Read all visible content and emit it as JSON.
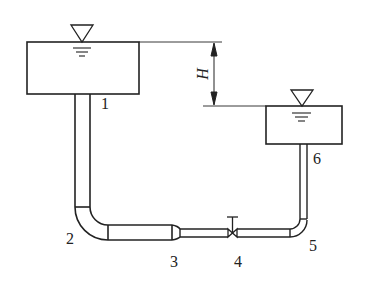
{
  "diagram": {
    "dimension": {
      "symbol": "H",
      "meaning": "head difference between free surfaces"
    },
    "labels": [
      {
        "id": "1",
        "text": "1",
        "x": 101,
        "y": 100
      },
      {
        "id": "2",
        "text": "2",
        "x": 66,
        "y": 234
      },
      {
        "id": "3",
        "text": "3",
        "x": 170,
        "y": 256
      },
      {
        "id": "4",
        "text": "4",
        "x": 234,
        "y": 256
      },
      {
        "id": "5",
        "text": "5",
        "x": 309,
        "y": 240
      },
      {
        "id": "6",
        "text": "6",
        "x": 313,
        "y": 153
      }
    ],
    "components": [
      "upper-reservoir",
      "lower-reservoir",
      "vertical-pipe",
      "bend",
      "sudden-contraction",
      "valve",
      "bend",
      "vertical-pipe"
    ],
    "colors": {
      "line": "#222222",
      "background": "#ffffff"
    }
  }
}
